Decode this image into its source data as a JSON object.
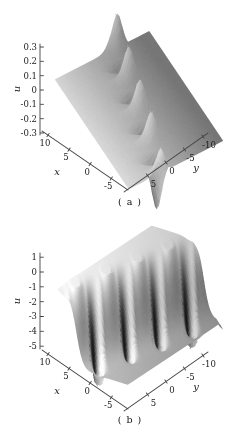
{
  "palette": {
    "background": "#ffffff",
    "axis": "#444444",
    "text": "#222222",
    "surface_light": "#eeeeee",
    "surface_dark": "#3a3a3a"
  },
  "chart_data": [
    {
      "id": "a",
      "type": "surface",
      "caption": "( a )",
      "axes": {
        "x": {
          "label": "x",
          "range": [
            -10,
            10
          ],
          "ticks": [
            "10",
            "5",
            "0",
            "-5"
          ],
          "tick_values": [
            10,
            5,
            0,
            -5
          ]
        },
        "y": {
          "label": "y",
          "range": [
            -10,
            10
          ],
          "ticks": [
            "5",
            "0",
            "-5",
            "-10"
          ],
          "tick_values": [
            5,
            0,
            -5,
            -10
          ]
        },
        "u": {
          "label": "u",
          "range": [
            -0.45,
            0.35
          ],
          "ticks": [
            "0.3",
            "0.2",
            "0.1",
            "0",
            "-0.1",
            "-0.2",
            "-0.3"
          ],
          "tick_values": [
            0.3,
            0.2,
            0.1,
            0,
            -0.1,
            -0.2,
            -0.3
          ]
        }
      },
      "surface": {
        "kind": "periodic-chain-of-peaks-and-dips",
        "description": "flat background near u=0 with a diagonal chain of 4 sharp upward peaks (u max ~0.35) alternating with 4 sharp downward spikes (u min ~ -0.45) along the line y = -0.3x",
        "background_level": 0.03,
        "peak_amplitude": 0.34,
        "dip_amplitude": 0.47,
        "chain_tilt": 0.3,
        "chain_offset": 0,
        "period": 5.4,
        "envelope_width": 1.15,
        "phase": 2.1,
        "num_peaks": 4,
        "num_dips": 4
      }
    },
    {
      "id": "b",
      "type": "surface",
      "caption": "( b )",
      "axes": {
        "x": {
          "label": "x",
          "range": [
            -10,
            10
          ],
          "ticks": [
            "10",
            "5",
            "0",
            "-5"
          ],
          "tick_values": [
            10,
            5,
            0,
            -5
          ]
        },
        "y": {
          "label": "y",
          "range": [
            -10,
            10
          ],
          "ticks": [
            "5",
            "0",
            "-5",
            "-10"
          ],
          "tick_values": [
            5,
            0,
            -5,
            -10
          ]
        },
        "u": {
          "label": "u",
          "range": [
            -5,
            1
          ],
          "ticks": [
            "1",
            "0",
            "-1",
            "-2",
            "-3",
            "-4",
            "-5"
          ],
          "tick_values": [
            1,
            0,
            -1,
            -2,
            -3,
            -4,
            -5
          ]
        }
      },
      "surface": {
        "kind": "scalloped-kink",
        "description": "kink surface dropping from a high plateau u~1 (back/left) to a low plateau u~ -4 (front/right), cut by 4 periodic diagonal grooves ending in deep funnels (u min ~ -5) with cusped rim peaks along the top edge",
        "high_plateau": 1,
        "low_plateau": -4,
        "kink_direction": 0.475,
        "kink_width": 1.9,
        "groove_period": 6.0,
        "groove_phase": 0.5,
        "groove_depth": 1.5,
        "funnel_depth": 1.4,
        "rim_height": 0.6,
        "num_grooves": 4
      }
    }
  ]
}
